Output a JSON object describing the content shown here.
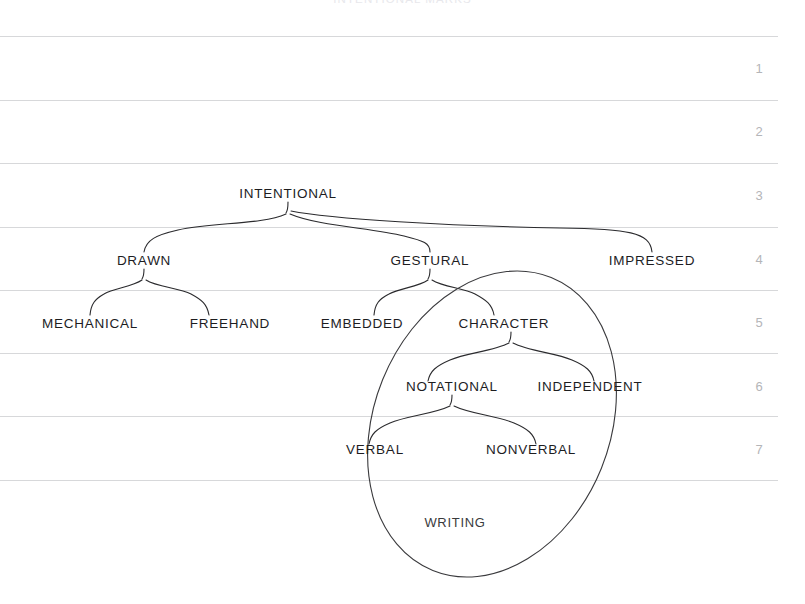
{
  "figure": {
    "caption": "INTENTIONAL MARKS",
    "type": "tree-taxonomy-diagram"
  },
  "grid": {
    "row_numbers": [
      "1",
      "2",
      "3",
      "4",
      "5",
      "6",
      "7"
    ],
    "rule_color": "#d7d8da",
    "number_color": "#b4b5b8",
    "rule_y": [
      36,
      100,
      163,
      227,
      290,
      353,
      416,
      480
    ],
    "number_y": [
      68,
      131,
      195,
      259,
      322,
      386,
      449
    ]
  },
  "tree": {
    "ink_color": "#2b2b2e",
    "text_color": "#1d1d1f",
    "nodes": [
      {
        "id": "intentional",
        "label": "INTENTIONAL",
        "x": 288,
        "y": 193,
        "level": 3
      },
      {
        "id": "drawn",
        "label": "DRAWN",
        "x": 144,
        "y": 260,
        "level": 4
      },
      {
        "id": "gestural",
        "label": "GESTURAL",
        "x": 430,
        "y": 260,
        "level": 4
      },
      {
        "id": "impressed",
        "label": "IMPRESSED",
        "x": 652,
        "y": 260,
        "level": 4
      },
      {
        "id": "mechanical",
        "label": "MECHANICAL",
        "x": 90,
        "y": 323,
        "level": 5
      },
      {
        "id": "freehand",
        "label": "FREEHAND",
        "x": 230,
        "y": 323,
        "level": 5
      },
      {
        "id": "embedded",
        "label": "EMBEDDED",
        "x": 362,
        "y": 323,
        "level": 5
      },
      {
        "id": "character",
        "label": "CHARACTER",
        "x": 504,
        "y": 323,
        "level": 5
      },
      {
        "id": "notational",
        "label": "NOTATIONAL",
        "x": 452,
        "y": 386,
        "level": 6
      },
      {
        "id": "independent",
        "label": "INDEPENDENT",
        "x": 590,
        "y": 386,
        "level": 6
      },
      {
        "id": "verbal",
        "label": "VERBAL",
        "x": 375,
        "y": 449,
        "level": 7
      },
      {
        "id": "nonverbal",
        "label": "NONVERBAL",
        "x": 531,
        "y": 449,
        "level": 7
      }
    ],
    "edges": [
      {
        "parent": "intentional",
        "children": [
          "drawn",
          "gestural",
          "impressed"
        ]
      },
      {
        "parent": "drawn",
        "children": [
          "mechanical",
          "freehand"
        ]
      },
      {
        "parent": "gestural",
        "children": [
          "embedded",
          "character"
        ]
      },
      {
        "parent": "character",
        "children": [
          "notational",
          "independent"
        ]
      },
      {
        "parent": "notational",
        "children": [
          "verbal",
          "nonverbal"
        ]
      }
    ]
  },
  "grouping": {
    "label": "WRITING",
    "label_x": 455,
    "label_y": 522,
    "shape": "ellipse",
    "center_x": 492,
    "center_y": 424,
    "radius_x": 118,
    "radius_y": 158,
    "rotation_deg": 22,
    "stroke": "#3a3a3d",
    "encloses": [
      "character",
      "notational",
      "independent",
      "verbal",
      "nonverbal"
    ]
  }
}
